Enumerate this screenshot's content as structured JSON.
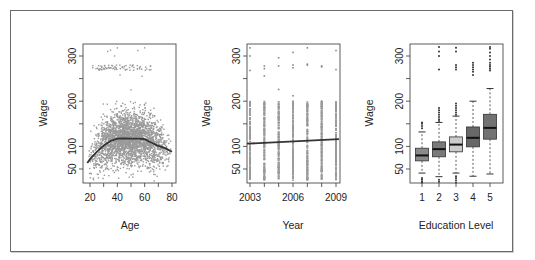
{
  "chart_data": [
    {
      "type": "scatter",
      "title": "",
      "xlabel": "Age",
      "ylabel": "Wage",
      "xlim": [
        17,
        81
      ],
      "ylim": [
        20,
        330
      ],
      "xticks": [
        20,
        30,
        40,
        50,
        60,
        70,
        80
      ],
      "xtick_labels": [
        "20",
        "40",
        "60",
        "80"
      ],
      "yticks": [
        50,
        100,
        150,
        200,
        250,
        300
      ],
      "ytick_labels": [
        "50",
        "100",
        "200",
        "300"
      ],
      "grid": false,
      "point_color": "#9a9a9a",
      "smooth_curve": {
        "color": "#333333",
        "x": [
          18,
          20,
          25,
          30,
          35,
          40,
          45,
          50,
          55,
          60,
          65,
          70,
          75,
          80
        ],
        "y": [
          63,
          72,
          88,
          102,
          112,
          117,
          118,
          117,
          117,
          116,
          108,
          101,
          96,
          88
        ]
      },
      "scatter_description": "Dense cloud of ~3000 points between wage 30-200 for ages 18-80, peaking in density around age 35-55; a separate band of high earners near wage 270-280 for ages 22-65 and a few outliers near 300-320."
    },
    {
      "type": "scatter",
      "title": "",
      "xlabel": "Year",
      "ylabel": "Wage",
      "xlim": [
        2002.8,
        2009.2
      ],
      "ylim": [
        20,
        330
      ],
      "xticks": [
        2003,
        2004,
        2005,
        2006,
        2007,
        2008,
        2009
      ],
      "xtick_labels": [
        "2003",
        "2006",
        "2009"
      ],
      "yticks": [
        50,
        100,
        150,
        200,
        250,
        300
      ],
      "ytick_labels": [
        "50",
        "100",
        "200",
        "300"
      ],
      "grid": false,
      "point_color": "#9a9a9a",
      "regression_line": {
        "color": "#333333",
        "x": [
          2003,
          2009
        ],
        "y": [
          106,
          116
        ]
      },
      "outliers": [
        {
          "x": 2003,
          "y": 318
        },
        {
          "x": 2003,
          "y": 300
        },
        {
          "x": 2003,
          "y": 268
        },
        {
          "x": 2004,
          "y": 278
        },
        {
          "x": 2004,
          "y": 272
        },
        {
          "x": 2004,
          "y": 256
        },
        {
          "x": 2005,
          "y": 296
        },
        {
          "x": 2005,
          "y": 278
        },
        {
          "x": 2005,
          "y": 226
        },
        {
          "x": 2006,
          "y": 308
        },
        {
          "x": 2006,
          "y": 280
        },
        {
          "x": 2006,
          "y": 274
        },
        {
          "x": 2006,
          "y": 212
        },
        {
          "x": 2006,
          "y": 200
        },
        {
          "x": 2007,
          "y": 318
        },
        {
          "x": 2007,
          "y": 282
        },
        {
          "x": 2007,
          "y": 280
        },
        {
          "x": 2008,
          "y": 278
        },
        {
          "x": 2008,
          "y": 276
        },
        {
          "x": 2008,
          "y": 200
        },
        {
          "x": 2009,
          "y": 312
        },
        {
          "x": 2009,
          "y": 270
        }
      ],
      "column_range": {
        "low": 25,
        "high": 200
      }
    },
    {
      "type": "box",
      "title": "",
      "xlabel": "Education Level",
      "ylabel": "Wage",
      "ylim": [
        20,
        330
      ],
      "categories": [
        "1",
        "2",
        "3",
        "4",
        "5"
      ],
      "yticks": [
        50,
        100,
        150,
        200,
        250,
        300
      ],
      "ytick_labels": [
        "50",
        "100",
        "200",
        "300"
      ],
      "grid": false,
      "boxes": [
        {
          "category": "1",
          "lower_whisker": 41,
          "q1": 68,
          "median": 80,
          "q3": 96,
          "upper_whisker": 132,
          "fill": "#8a8a8a",
          "outliers": [
            140,
            145,
            150,
            153,
            20,
            23,
            27,
            30
          ]
        },
        {
          "category": "2",
          "lower_whisker": 33,
          "q1": 77,
          "median": 94,
          "q3": 110,
          "upper_whisker": 153,
          "fill": "#7a7a7a",
          "outliers": [
            156,
            160,
            165,
            170,
            175,
            180,
            185,
            270,
            300,
            310,
            320,
            22,
            26
          ]
        },
        {
          "category": "3",
          "lower_whisker": 41,
          "q1": 88,
          "median": 104,
          "q3": 121,
          "upper_whisker": 167,
          "fill": "#cccccc",
          "outliers": [
            170,
            175,
            180,
            185,
            190,
            195,
            270,
            275,
            280,
            310,
            318,
            20,
            25,
            30,
            34
          ]
        },
        {
          "category": "4",
          "lower_whisker": 34,
          "q1": 99,
          "median": 119,
          "q3": 143,
          "upper_whisker": 200,
          "fill": "#686868",
          "outliers": [
            258,
            265,
            270,
            275,
            280,
            285
          ]
        },
        {
          "category": "5",
          "lower_whisker": 39,
          "q1": 116,
          "median": 141,
          "q3": 171,
          "upper_whisker": 228,
          "fill": "#727272",
          "outliers": [
            268,
            272,
            276,
            280,
            285,
            292,
            300,
            308,
            316,
            320
          ]
        }
      ]
    }
  ],
  "labels": {
    "ylabel": "Wage",
    "xlabel_age": "Age",
    "xlabel_year": "Year",
    "xlabel_edu": "Education Level"
  }
}
